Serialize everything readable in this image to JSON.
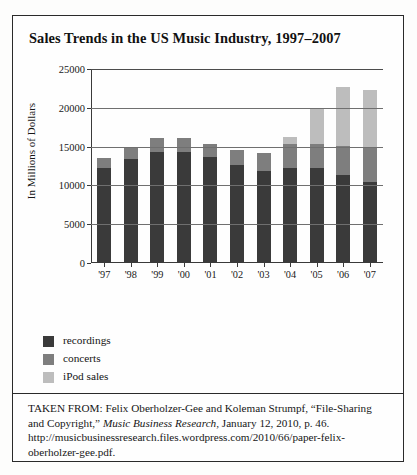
{
  "figure": {
    "title": "Sales Trends in the US Music Industry, 1997–2007",
    "caption_part1": "TAKEN FROM: Felix Oberholzer-Gee and Koleman Strumpf, “File-Sharing and Copyright,” ",
    "caption_italic": "Music Business Research",
    "caption_part2": ", January 12, 2010, p. 46. http://musicbusinessresearch.files.wordpress.com/2010/66/paper-felix-oberholzer-gee.pdf."
  },
  "legend": {
    "items": [
      {
        "label": "recordings",
        "color": "#3a3a3a"
      },
      {
        "label": "concerts",
        "color": "#7e7e7e"
      },
      {
        "label": "iPod sales",
        "color": "#bdbdbd"
      }
    ]
  },
  "chart_data": {
    "type": "bar",
    "subtype": "stacked",
    "title": "Sales Trends in the US Music Industry, 1997–2007",
    "xlabel": "",
    "ylabel": "In Millions of Dollars",
    "categories": [
      "'97",
      "'98",
      "'99",
      "'00",
      "'01",
      "'02",
      "'03",
      "'04",
      "'05",
      "'06",
      "'07"
    ],
    "ylim": [
      0,
      25000
    ],
    "yticks": [
      0,
      5000,
      10000,
      15000,
      20000,
      25000
    ],
    "ytick_labels": [
      "0",
      "5000",
      "10000",
      "15000",
      "20000",
      "25000"
    ],
    "grid": true,
    "legend_position": "below-left",
    "series": [
      {
        "name": "recordings",
        "color": "#3a3a3a",
        "values": [
          12200,
          13400,
          14300,
          14300,
          13600,
          12600,
          11800,
          12200,
          12200,
          11400,
          10400
        ]
      },
      {
        "name": "concerts",
        "color": "#7e7e7e",
        "values": [
          1300,
          1500,
          1800,
          1800,
          1800,
          2000,
          2400,
          3100,
          3100,
          3700,
          4600
        ]
      },
      {
        "name": "iPod sales",
        "color": "#bdbdbd",
        "values": [
          0,
          0,
          0,
          0,
          0,
          0,
          0,
          1000,
          4500,
          7600,
          7300
        ]
      }
    ],
    "totals": [
      13500,
      14900,
      16100,
      16100,
      15400,
      14600,
      14200,
      16300,
      19800,
      22700,
      22300
    ]
  }
}
